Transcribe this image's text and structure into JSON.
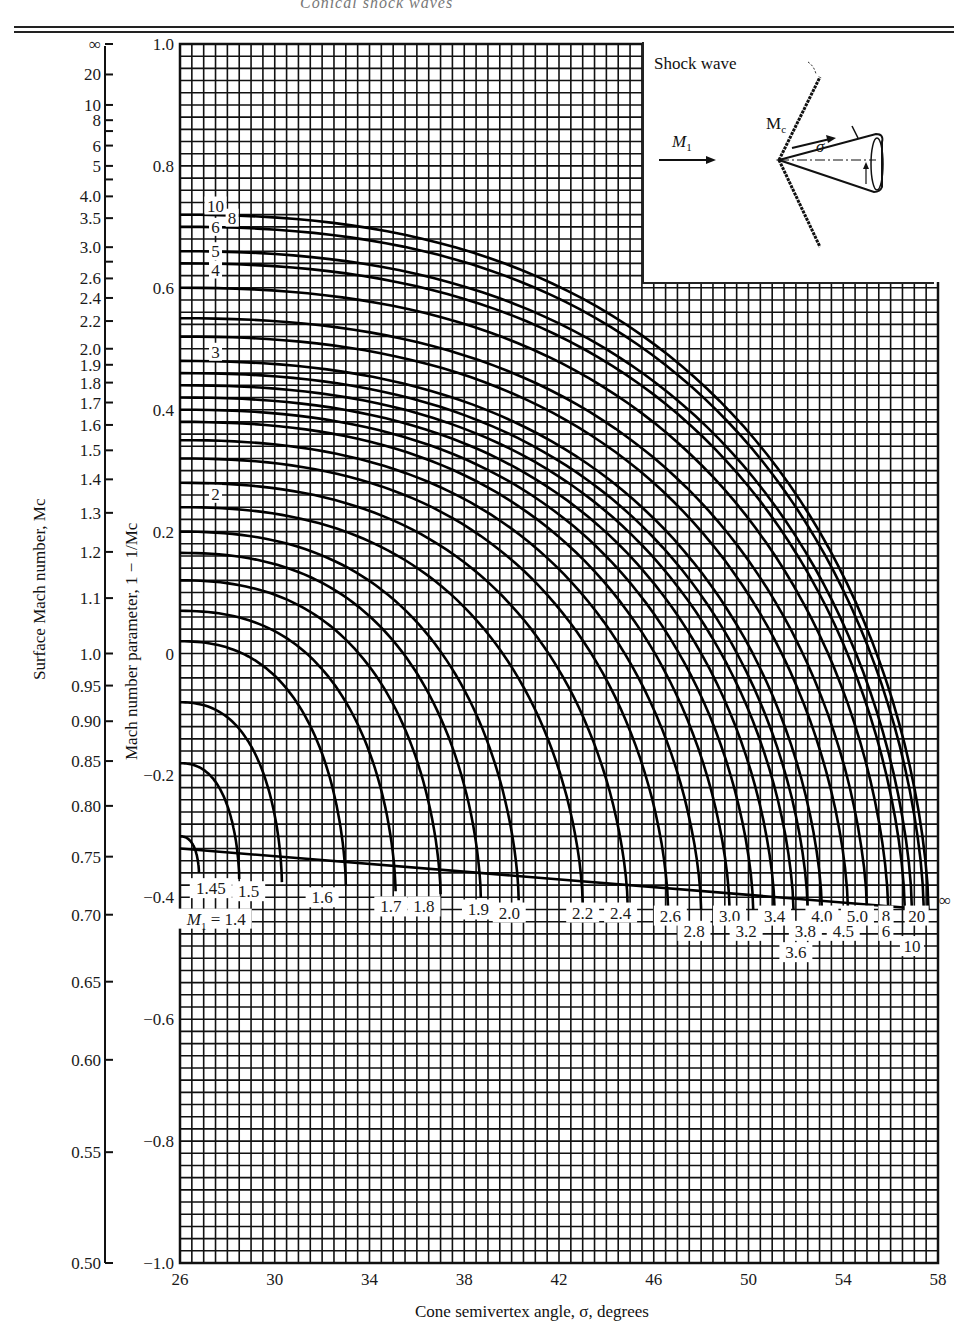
{
  "page": {
    "running_header": "Conical shock waves",
    "footer_none": ""
  },
  "chart_data": {
    "type": "line",
    "title": "",
    "xlabel": "Cone semivertex angle, σ, degrees",
    "ylabel": "Mach number parameter, 1 − 1/Mc",
    "ylabel_secondary": "Surface Mach number, Mc",
    "xlim": [
      26,
      58
    ],
    "ylim": [
      -1.0,
      1.0
    ],
    "x_ticks": [
      26,
      30,
      34,
      38,
      42,
      46,
      50,
      54,
      58
    ],
    "y_ticks": [
      {
        "v": 1.0,
        "label": "1.0"
      },
      {
        "v": 0.8,
        "label": "0.8"
      },
      {
        "v": 0.6,
        "label": "0.6"
      },
      {
        "v": 0.4,
        "label": "0.4"
      },
      {
        "v": 0.2,
        "label": "0.2"
      },
      {
        "v": 0,
        "label": "0"
      },
      {
        "v": -0.2,
        "label": "−0.2"
      },
      {
        "v": -0.4,
        "label": "−0.4"
      },
      {
        "v": -0.6,
        "label": "−0.6"
      },
      {
        "v": -0.8,
        "label": "−0.8"
      },
      {
        "v": -1.0,
        "label": "−1.0"
      }
    ],
    "secondary_ticks": [
      {
        "label": "∞",
        "mc": "inf"
      },
      {
        "label": "20",
        "mc": 20
      },
      {
        "label": "10",
        "mc": 10
      },
      {
        "label": "8",
        "mc": 8
      },
      {
        "label": "6",
        "mc": 6
      },
      {
        "label": "5",
        "mc": 5
      },
      {
        "label": "4.0",
        "mc": 4.0
      },
      {
        "label": "3.5",
        "mc": 3.5
      },
      {
        "label": "3.0",
        "mc": 3.0
      },
      {
        "label": "2.6",
        "mc": 2.6
      },
      {
        "label": "2.4",
        "mc": 2.4
      },
      {
        "label": "2.2",
        "mc": 2.2
      },
      {
        "label": "2.0",
        "mc": 2.0
      },
      {
        "label": "1.9",
        "mc": 1.9
      },
      {
        "label": "1.8",
        "mc": 1.8
      },
      {
        "label": "1.7",
        "mc": 1.7
      },
      {
        "label": "1.6",
        "mc": 1.6
      },
      {
        "label": "1.5",
        "mc": 1.5
      },
      {
        "label": "1.4",
        "mc": 1.4
      },
      {
        "label": "1.3",
        "mc": 1.3
      },
      {
        "label": "1.2",
        "mc": 1.2
      },
      {
        "label": "1.1",
        "mc": 1.1
      },
      {
        "label": "1.0",
        "mc": 1.0
      },
      {
        "label": "0.95",
        "mc": 0.95
      },
      {
        "label": "0.90",
        "mc": 0.9
      },
      {
        "label": "0.85",
        "mc": 0.85
      },
      {
        "label": "0.80",
        "mc": 0.8
      },
      {
        "label": "0.75",
        "mc": 0.75
      },
      {
        "label": "0.70",
        "mc": 0.7
      },
      {
        "label": "0.65",
        "mc": 0.65
      },
      {
        "label": "0.60",
        "mc": 0.6
      },
      {
        "label": "0.55",
        "mc": 0.55
      },
      {
        "label": "0.50",
        "mc": 0.5
      }
    ],
    "grid": true,
    "grid_minor_x": 0.5,
    "grid_minor_y": 0.02,
    "series_parameter": "M1 (free-stream Mach number)",
    "series": [
      {
        "name": "1.4",
        "y0": -0.3,
        "x_end": 26.8,
        "y_end": -0.36
      },
      {
        "name": "1.45",
        "y0": -0.18,
        "x_end": 28.5,
        "y_end": -0.37
      },
      {
        "name": "1.5",
        "y0": -0.08,
        "x_end": 30.3,
        "y_end": -0.375
      },
      {
        "name": "1.6",
        "y0": 0.02,
        "x_end": 33.0,
        "y_end": -0.38
      },
      {
        "name": "1.7",
        "y0": 0.07,
        "x_end": 35.1,
        "y_end": -0.39
      },
      {
        "name": "1.8",
        "y0": 0.12,
        "x_end": 37.0,
        "y_end": -0.395
      },
      {
        "name": "1.9",
        "y0": 0.165,
        "x_end": 38.7,
        "y_end": -0.4
      },
      {
        "name": "2.0",
        "y0": 0.2,
        "x_end": 40.3,
        "y_end": -0.405
      },
      {
        "name": "2.2",
        "y0": 0.24,
        "x_end": 43.0,
        "y_end": -0.41
      },
      {
        "name": "2.4",
        "y0": 0.28,
        "x_end": 44.9,
        "y_end": -0.415
      },
      {
        "name": "2.6",
        "y0": 0.32,
        "x_end": 46.6,
        "y_end": -0.415
      },
      {
        "name": "2.8",
        "y0": 0.35,
        "x_end": 48.0,
        "y_end": -0.42
      },
      {
        "name": "3.0",
        "y0": 0.38,
        "x_end": 49.2,
        "y_end": -0.42
      },
      {
        "name": "3.2",
        "y0": 0.4,
        "x_end": 50.2,
        "y_end": -0.42
      },
      {
        "name": "3.4",
        "y0": 0.42,
        "x_end": 51.1,
        "y_end": -0.42
      },
      {
        "name": "3.6",
        "y0": 0.44,
        "x_end": 51.9,
        "y_end": -0.42
      },
      {
        "name": "3.8",
        "y0": 0.46,
        "x_end": 52.5,
        "y_end": -0.42
      },
      {
        "name": "4.0",
        "y0": 0.48,
        "x_end": 53.1,
        "y_end": -0.42
      },
      {
        "name": "4.5",
        "y0": 0.52,
        "x_end": 54.2,
        "y_end": -0.42
      },
      {
        "name": "5.0",
        "y0": 0.55,
        "x_end": 55.0,
        "y_end": -0.42
      },
      {
        "name": "6",
        "y0": 0.6,
        "x_end": 55.9,
        "y_end": -0.42
      },
      {
        "name": "8",
        "y0": 0.64,
        "x_end": 56.6,
        "y_end": -0.42
      },
      {
        "name": "10",
        "y0": 0.66,
        "x_end": 56.9,
        "y_end": -0.42
      },
      {
        "name": "20",
        "y0": 0.7,
        "x_end": 57.4,
        "y_end": -0.42
      },
      {
        "name": "∞",
        "y0": 0.72,
        "x_end": 57.6,
        "y_end": -0.42
      }
    ],
    "boundary_line": {
      "x": [
        26,
        57.6
      ],
      "y": [
        -0.32,
        -0.42
      ]
    },
    "left_curve_labels": [
      "10",
      "8",
      "6",
      "5",
      "4",
      "3",
      "2"
    ],
    "bottom_curve_labels": [
      {
        "text": "M1 = 1.4",
        "x": 26.2,
        "y": -0.435
      },
      {
        "text": "1.45",
        "x": 27.3,
        "y": -0.385
      },
      {
        "text": "1.5",
        "x": 28.9,
        "y": -0.39
      },
      {
        "text": "1.6",
        "x": 32.0,
        "y": -0.4
      },
      {
        "text": "1.7",
        "x": 34.9,
        "y": -0.415
      },
      {
        "text": "1.8",
        "x": 36.3,
        "y": -0.415
      },
      {
        "text": "1.9",
        "x": 38.6,
        "y": -0.42
      },
      {
        "text": "2.0",
        "x": 39.9,
        "y": -0.425
      },
      {
        "text": "2.2",
        "x": 43.0,
        "y": -0.425
      },
      {
        "text": "2.4",
        "x": 44.6,
        "y": -0.425
      },
      {
        "text": "2.6",
        "x": 46.7,
        "y": -0.43
      },
      {
        "text": "2.8",
        "x": 47.7,
        "y": -0.455
      },
      {
        "text": "3.0",
        "x": 49.2,
        "y": -0.43
      },
      {
        "text": "3.2",
        "x": 49.9,
        "y": -0.455
      },
      {
        "text": "3.4",
        "x": 51.1,
        "y": -0.43
      },
      {
        "text": "3.6",
        "x": 52.0,
        "y": -0.49
      },
      {
        "text": "3.8",
        "x": 52.4,
        "y": -0.455
      },
      {
        "text": "4.0",
        "x": 53.1,
        "y": -0.43
      },
      {
        "text": "4.5",
        "x": 54.0,
        "y": -0.455
      },
      {
        "text": "5.0",
        "x": 54.6,
        "y": -0.43
      },
      {
        "text": "8",
        "x": 55.8,
        "y": -0.43
      },
      {
        "text": "6",
        "x": 55.8,
        "y": -0.455
      },
      {
        "text": "20",
        "x": 57.1,
        "y": -0.43
      },
      {
        "text": "10",
        "x": 56.9,
        "y": -0.48
      },
      {
        "text": "∞",
        "x": 58.3,
        "y": -0.405
      }
    ]
  },
  "inset": {
    "shock_label": "Shock wave",
    "freestream_label": "M",
    "freestream_sub": "1",
    "surface_label": "M",
    "surface_sub": "c",
    "angle_label": "σ"
  },
  "axes": {
    "xlabel": "Cone semivertex angle, σ, degrees",
    "ylabel_primary": "Mach number parameter, 1 − ",
    "ylabel_primary_frac": "1/Mc",
    "ylabel_secondary": "Surface Mach number, Mc"
  }
}
